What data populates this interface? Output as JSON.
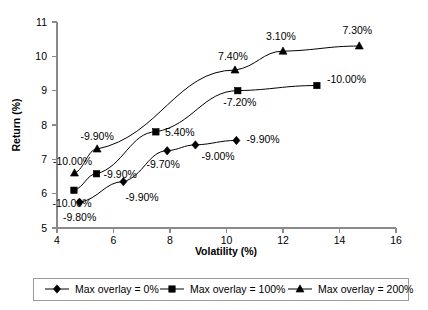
{
  "chart_data": {
    "type": "line",
    "title": "",
    "xlabel": "Volatility (%)",
    "ylabel": "Return (%)",
    "xlim": [
      4,
      16
    ],
    "ylim": [
      5,
      11
    ],
    "xticks": [
      "4",
      "6",
      "8",
      "10",
      "12",
      "14",
      "16"
    ],
    "yticks": [
      "5",
      "6",
      "7",
      "8",
      "9",
      "10",
      "11"
    ],
    "grid": false,
    "legend_position": "bottom",
    "series": [
      {
        "name": "Max overlay = 0%",
        "marker": "diamond",
        "x": [
          4.8,
          6.35,
          7.9,
          8.9,
          10.35
        ],
        "y": [
          5.75,
          6.35,
          7.25,
          7.42,
          7.55
        ],
        "labels": [
          "-9.80%",
          "-9.90%",
          "-9.70%",
          "-9.00%",
          "-9.90%"
        ]
      },
      {
        "name": "Max overlay = 100%",
        "marker": "square",
        "x": [
          4.6,
          5.4,
          7.5,
          10.4,
          13.2
        ],
        "y": [
          6.1,
          6.58,
          7.8,
          9.0,
          9.15
        ],
        "labels": [
          "-10.00%",
          "-9.90%",
          "5.40%",
          "-7.20%",
          "-10.00%"
        ]
      },
      {
        "name": "Max overlay = 200%",
        "marker": "triangle",
        "x": [
          4.62,
          5.42,
          10.3,
          12.0,
          14.7
        ],
        "y": [
          6.6,
          7.3,
          9.6,
          10.15,
          10.3
        ],
        "labels": [
          "-10.00%",
          "-9.90%",
          "7.40%",
          "3.10%",
          "7.30%"
        ]
      }
    ]
  },
  "legend": {
    "items": [
      {
        "label": "Max overlay = 0%",
        "marker": "diamond"
      },
      {
        "label": "Max overlay = 100%",
        "marker": "square"
      },
      {
        "label": "Max overlay = 200%",
        "marker": "triangle"
      }
    ]
  }
}
